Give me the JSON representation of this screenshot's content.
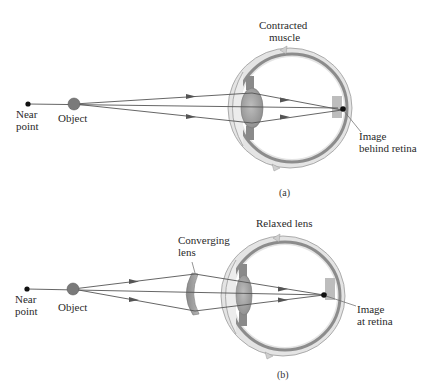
{
  "figure": {
    "panels": [
      {
        "id": "a",
        "caption": "(a)",
        "labels": {
          "near_point": [
            "Near",
            "point"
          ],
          "object": "Object",
          "muscle": [
            "Contracted",
            "muscle"
          ],
          "image": [
            "Image",
            "behind retina"
          ]
        }
      },
      {
        "id": "b",
        "caption": "(b)",
        "labels": {
          "near_point": [
            "Near",
            "point"
          ],
          "object": "Object",
          "converging_lens": [
            "Converging",
            "lens"
          ],
          "relaxed_lens": "Relaxed lens",
          "image": [
            "Image",
            "at retina"
          ]
        }
      }
    ],
    "colors": {
      "ray": "#555555",
      "object": "#7a7a7a",
      "point": "#111111",
      "sclera": "#d9d9d9",
      "choroid": "#8c8c8c",
      "lens": "#a8a8a8",
      "corrective_lens": "#9a9a9a"
    }
  }
}
